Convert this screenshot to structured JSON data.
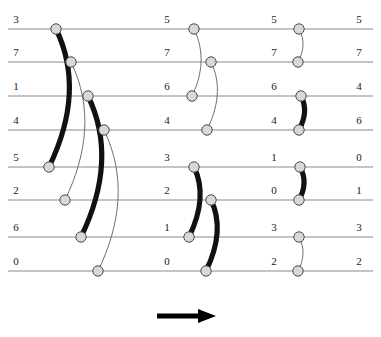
{
  "diagram": {
    "wire_count": 8,
    "stage_count": 4,
    "direction_arrow": "rightwards-arrow",
    "colors": {
      "wire": "#8a8a8a",
      "thick_comparator": "#111111",
      "thin_comparator": "#6f6f6f",
      "node_fill": "#d8d8d8",
      "node_stroke": "#4a4a4a",
      "arrow": "#000000",
      "label": "#1a1a1a",
      "background": "#ffffff"
    },
    "wire_y": [
      29,
      62,
      96,
      130,
      167,
      200,
      237,
      271
    ],
    "columns": [
      {
        "name": "stage-0-input",
        "x": 12,
        "values": [
          "3",
          "7",
          "1",
          "4",
          "5",
          "2",
          "6",
          "0"
        ]
      },
      {
        "name": "stage-1-output",
        "x": 163,
        "values": [
          "5",
          "7",
          "6",
          "4",
          "3",
          "2",
          "1",
          "0"
        ]
      },
      {
        "name": "stage-2-output",
        "x": 270,
        "values": [
          "5",
          "7",
          "6",
          "4",
          "1",
          "0",
          "3",
          "2"
        ]
      },
      {
        "name": "stage-3-output",
        "x": 355,
        "values": [
          "5",
          "7",
          "4",
          "6",
          "0",
          "1",
          "3",
          "2"
        ]
      }
    ],
    "comparators": [
      {
        "id": "c1",
        "group": 1,
        "top_wire": 0,
        "bottom_wire": 4,
        "x_top": 56,
        "x_bottom": 49,
        "weight": "thick"
      },
      {
        "id": "c2",
        "group": 1,
        "top_wire": 1,
        "bottom_wire": 5,
        "x_top": 71,
        "x_bottom": 65,
        "weight": "thin"
      },
      {
        "id": "c3",
        "group": 1,
        "top_wire": 2,
        "bottom_wire": 6,
        "x_top": 88,
        "x_bottom": 81,
        "weight": "thick"
      },
      {
        "id": "c4",
        "group": 1,
        "top_wire": 3,
        "bottom_wire": 7,
        "x_top": 104,
        "x_bottom": 98,
        "weight": "thin"
      },
      {
        "id": "c5",
        "group": 2,
        "top_wire": 0,
        "bottom_wire": 2,
        "x_top": 194,
        "x_bottom": 192,
        "weight": "thin"
      },
      {
        "id": "c6",
        "group": 2,
        "top_wire": 1,
        "bottom_wire": 3,
        "x_top": 211,
        "x_bottom": 207,
        "weight": "thin"
      },
      {
        "id": "c7",
        "group": 2,
        "top_wire": 4,
        "bottom_wire": 6,
        "x_top": 194,
        "x_bottom": 189,
        "weight": "thick"
      },
      {
        "id": "c8",
        "group": 2,
        "top_wire": 5,
        "bottom_wire": 7,
        "x_top": 211,
        "x_bottom": 206,
        "weight": "thick"
      },
      {
        "id": "c9",
        "group": 3,
        "top_wire": 0,
        "bottom_wire": 1,
        "x_top": 299,
        "x_bottom": 298,
        "weight": "thin"
      },
      {
        "id": "c10",
        "group": 3,
        "top_wire": 2,
        "bottom_wire": 3,
        "x_top": 301,
        "x_bottom": 299,
        "weight": "thick"
      },
      {
        "id": "c11",
        "group": 3,
        "top_wire": 4,
        "bottom_wire": 5,
        "x_top": 300,
        "x_bottom": 299,
        "weight": "thick"
      },
      {
        "id": "c12",
        "group": 3,
        "top_wire": 6,
        "bottom_wire": 7,
        "x_top": 299,
        "x_bottom": 298,
        "weight": "thin"
      }
    ],
    "arrow": {
      "x1": 157,
      "x2": 200,
      "tip_x": 216,
      "y": 316
    }
  }
}
